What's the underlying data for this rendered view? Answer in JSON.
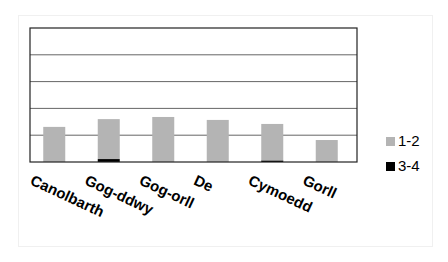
{
  "chart_data": {
    "type": "bar",
    "stacked": true,
    "title": "",
    "xlabel": "",
    "ylabel": "",
    "ylim": [
      0,
      5
    ],
    "grid": true,
    "y_tick_labels_shown": false,
    "categories": [
      "Canolbarth",
      "Gog-ddwy",
      "Gog-orll",
      "De",
      "Cymoedd",
      "Gorll"
    ],
    "series": [
      {
        "name": "3-4",
        "color": "#000000",
        "values": [
          0,
          0.11,
          0,
          0,
          0.06,
          0
        ]
      },
      {
        "name": "1-2",
        "color": "#b4b4b4",
        "values": [
          1.31,
          1.49,
          1.68,
          1.57,
          1.36,
          0.82
        ]
      }
    ],
    "legend": {
      "position": "right",
      "entries": [
        {
          "label": "1-2",
          "color": "#b4b4b4"
        },
        {
          "label": "3-4",
          "color": "#000000"
        }
      ]
    }
  }
}
